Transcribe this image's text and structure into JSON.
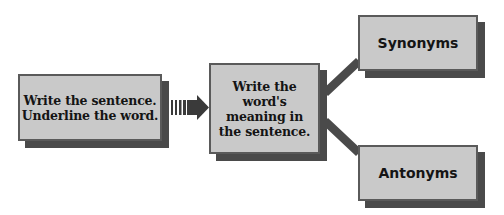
{
  "diagram": {
    "type": "flowchart",
    "colors": {
      "box_fill": "#c9c9c9",
      "box_border": "#5a5a5a",
      "shadow": "#4a4a4a",
      "connector": "#4a4a4a",
      "text": "#141414"
    },
    "nodes": {
      "start": {
        "lines": [
          "Write the sentence.",
          "Underline the word."
        ]
      },
      "meaning": {
        "lines": [
          "Write the",
          "word's",
          "meaning in",
          "the sentence."
        ]
      },
      "synonyms": {
        "label": "Synonyms"
      },
      "antonyms": {
        "label": "Antonyms"
      }
    },
    "edges": [
      {
        "from": "start",
        "to": "meaning",
        "style": "striped-arrow"
      },
      {
        "from": "meaning",
        "to": "synonyms",
        "style": "thick-line"
      },
      {
        "from": "meaning",
        "to": "antonyms",
        "style": "thick-line"
      }
    ],
    "icons": {
      "arrow": "striped-right-arrow-icon"
    }
  }
}
